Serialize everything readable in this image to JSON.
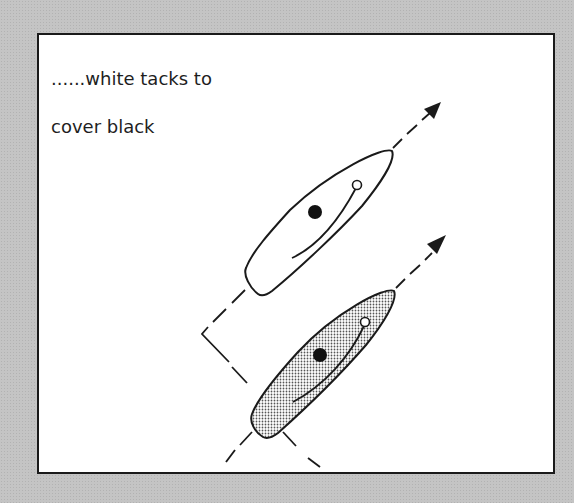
{
  "diagram": {
    "caption_line1": "......white tacks to",
    "caption_line2": "cover black",
    "colors": {
      "background": "#c4c4c4",
      "panel": "#ffffff",
      "ink": "#1a1a1a",
      "shaded_hull": "#c9c9c9"
    },
    "boats": [
      {
        "name": "white-boat",
        "fill": "white",
        "heading": "up-right",
        "position": "upper"
      },
      {
        "name": "black-boat",
        "fill": "shaded",
        "heading": "up-right",
        "position": "lower"
      }
    ]
  }
}
